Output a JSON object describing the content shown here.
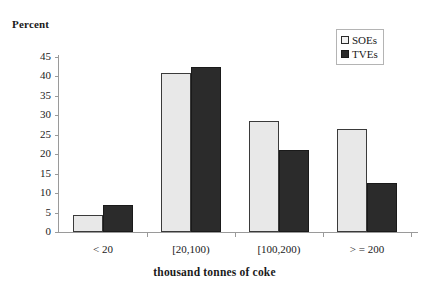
{
  "chart_data": {
    "type": "bar",
    "title": "",
    "ylabel": "Percent",
    "xlabel": "thousand tonnes of coke",
    "categories": [
      "< 20",
      "[20,100)",
      "[100,200)",
      "> = 200"
    ],
    "series": [
      {
        "name": "SOEs",
        "values": [
          4.3,
          41,
          28.5,
          26.5
        ],
        "color": "#e8e8e8"
      },
      {
        "name": "TVEs",
        "values": [
          7,
          42.5,
          21,
          12.5
        ],
        "color": "#2b2b2b"
      }
    ],
    "ylim": [
      0,
      45
    ],
    "yticks": [
      0,
      5,
      10,
      15,
      20,
      25,
      30,
      35,
      40,
      45
    ],
    "ytick_labels": [
      "0",
      "5",
      "10",
      "15",
      "20",
      "25",
      "30",
      "35",
      "40",
      "45"
    ],
    "grid": false,
    "legend_position": "top-right",
    "legend_entries": [
      "SOEs",
      "TVEs"
    ]
  }
}
